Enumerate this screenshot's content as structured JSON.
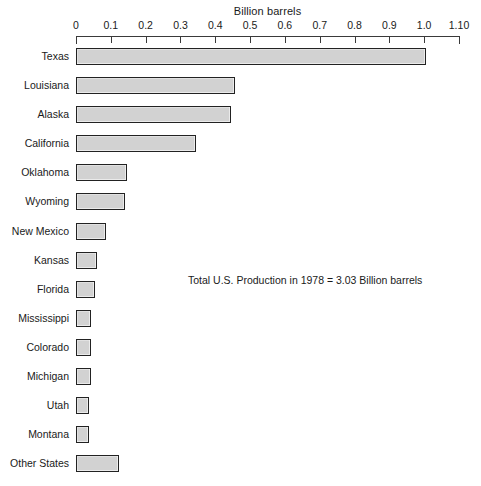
{
  "chart_data": {
    "type": "bar",
    "orientation": "horizontal",
    "title": "",
    "xlabel": "Billion barrels",
    "ylabel": "",
    "xlim": [
      0,
      1.1
    ],
    "grid": false,
    "legend": null,
    "tick_labels": [
      "0",
      "0.1",
      "0.2",
      "0.3",
      "0.4",
      "0.5",
      "0.6",
      "0.7",
      "0.8",
      "0.9",
      "1.0",
      "1.10"
    ],
    "tick_values": [
      0,
      0.1,
      0.2,
      0.3,
      0.4,
      0.5,
      0.6,
      0.7,
      0.8,
      0.9,
      1.0,
      1.1
    ],
    "categories": [
      "Texas",
      "Louisiana",
      "Alaska",
      "California",
      "Oklahoma",
      "Wyoming",
      "New Mexico",
      "Kansas",
      "Florida",
      "Mississippi",
      "Colorado",
      "Michigan",
      "Utah",
      "Montana",
      "Other States"
    ],
    "values": [
      1.005,
      0.456,
      0.445,
      0.346,
      0.146,
      0.141,
      0.085,
      0.06,
      0.054,
      0.043,
      0.043,
      0.043,
      0.037,
      0.037,
      0.124
    ],
    "annotations": [
      "Total U.S. Production in 1978 = 3.03 Billion barrels"
    ],
    "colors": {
      "bar_fill": "#d2d2d2",
      "bar_border": "#222222",
      "axis": "#3a3a3a",
      "text": "#1a1a1a",
      "background": "#ffffff"
    }
  }
}
